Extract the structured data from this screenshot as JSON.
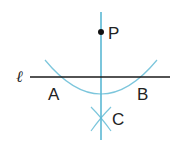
{
  "diagram": {
    "colors": {
      "line": "#1a1a1a",
      "construction": "#5bb8d4",
      "point": "#111111",
      "text": "#222222"
    },
    "labels": {
      "line": "ℓ",
      "point_p": "P",
      "point_a": "A",
      "point_b": "B",
      "point_c": "C"
    },
    "elements": [
      {
        "type": "line",
        "name": "ℓ",
        "from": [
          30,
          77
        ],
        "to": [
          170,
          77
        ]
      },
      {
        "type": "line",
        "name": "perpendicular",
        "from": [
          101,
          12
        ],
        "to": [
          101,
          140
        ]
      },
      {
        "type": "point",
        "name": "P",
        "at": [
          100,
          32
        ]
      },
      {
        "type": "arc",
        "center": "P",
        "through": [
          "A",
          "B"
        ]
      },
      {
        "type": "arc-pair",
        "centers": [
          "A",
          "B"
        ],
        "intersection": "C"
      }
    ]
  }
}
